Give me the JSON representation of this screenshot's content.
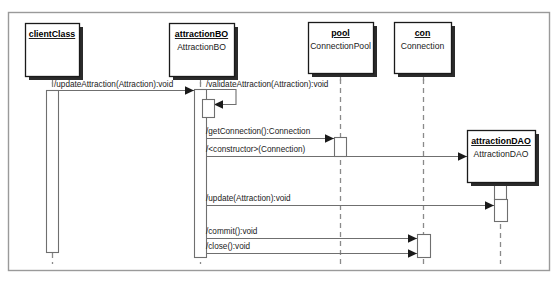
{
  "diagram": {
    "kind": "uml-sequence-diagram",
    "frame": {
      "x": 8,
      "y": 12,
      "width": 541,
      "height": 258
    },
    "colors": {
      "background": "#ffffff",
      "frame_border": "#9a9a9a",
      "box_border": "#1a1a1a",
      "box_fill": "#ffffff",
      "shadow": "#2b2b2b",
      "lifeline": "#8a8a8a",
      "message": "#6f6f6f",
      "arrowhead": "#1a1a1a",
      "text": "#1a1a1a"
    },
    "participants": [
      {
        "id": "clientClass",
        "name": "clientClass",
        "type": "",
        "box": {
          "x": 25,
          "y": 23,
          "width": 54,
          "height": 53
        },
        "lifeline_x": 52,
        "lifeline_top": 76,
        "lifeline_bottom": 264,
        "activations": [
          {
            "x": 46,
            "y": 90,
            "width": 12,
            "height": 162
          }
        ]
      },
      {
        "id": "attractionBO",
        "name": "attractionBO",
        "type": "AttractionBO",
        "box": {
          "x": 169,
          "y": 23,
          "width": 65,
          "height": 53
        },
        "lifeline_x": 200,
        "lifeline_top": 76,
        "lifeline_bottom": 264,
        "activations": [
          {
            "x": 194,
            "y": 89,
            "width": 12,
            "height": 168
          },
          {
            "x": 202,
            "y": 99,
            "width": 12,
            "height": 18
          }
        ]
      },
      {
        "id": "pool",
        "name": "pool",
        "type": "ConnectionPool",
        "box": {
          "x": 308,
          "y": 22,
          "width": 65,
          "height": 51
        },
        "lifeline_x": 340,
        "lifeline_top": 73,
        "lifeline_bottom": 264,
        "activations": [
          {
            "x": 334,
            "y": 137,
            "width": 12,
            "height": 19
          }
        ]
      },
      {
        "id": "con",
        "name": "con",
        "type": "Connection",
        "box": {
          "x": 394,
          "y": 22,
          "width": 57,
          "height": 51
        },
        "lifeline_x": 423,
        "lifeline_top": 73,
        "lifeline_bottom": 264,
        "activations": [
          {
            "x": 417,
            "y": 234,
            "width": 13,
            "height": 23
          }
        ]
      },
      {
        "id": "attractionDAO",
        "name": "attractionDAO",
        "type": "AttractionDAO",
        "box": {
          "x": 467,
          "y": 130,
          "width": 68,
          "height": 52
        },
        "lifeline_x": 500,
        "lifeline_top": 182,
        "lifeline_bottom": 264,
        "activations": [
          {
            "x": 494,
            "y": 182,
            "width": 12,
            "height": 17
          },
          {
            "x": 494,
            "y": 199,
            "width": 13,
            "height": 22
          }
        ]
      }
    ],
    "messages": [
      {
        "id": "msg-update-attraction",
        "label": "/updateAttraction(Attraction):void",
        "from": "clientClass",
        "to": "attractionBO",
        "y": 90,
        "x1": 52,
        "x2": 194,
        "label_x": 54,
        "label_y": 87,
        "kind": "call"
      },
      {
        "id": "msg-validate-attraction",
        "label": "/validateAttraction(Attraction):void",
        "from": "attractionBO",
        "to": "attractionBO",
        "y": 89,
        "x1": 204,
        "x2": 236,
        "label_x": 206,
        "label_y": 87,
        "kind": "self-call",
        "self_return_y": 104,
        "self_return_x": 214
      },
      {
        "id": "msg-get-connection",
        "label": "/getConnection():Connection",
        "from": "attractionBO",
        "to": "pool",
        "y": 138,
        "x1": 206,
        "x2": 334,
        "label_x": 206,
        "label_y": 134,
        "kind": "call"
      },
      {
        "id": "msg-constructor",
        "label": "/<constructor>(Connection)",
        "from": "attractionBO",
        "to": "attractionDAO",
        "y": 156,
        "x1": 206,
        "x2": 467,
        "label_x": 206,
        "label_y": 152,
        "kind": "create"
      },
      {
        "id": "msg-update",
        "label": "/update(Attraction):void",
        "from": "attractionBO",
        "to": "attractionDAO",
        "y": 205,
        "x1": 206,
        "x2": 494,
        "label_x": 206,
        "label_y": 201,
        "kind": "call"
      },
      {
        "id": "msg-commit",
        "label": "/commit():void",
        "from": "attractionBO",
        "to": "con",
        "y": 238,
        "x1": 206,
        "x2": 417,
        "label_x": 206,
        "label_y": 234,
        "kind": "call"
      },
      {
        "id": "msg-close",
        "label": "/close():void",
        "from": "attractionBO",
        "to": "con",
        "y": 253,
        "x1": 206,
        "x2": 417,
        "label_x": 206,
        "label_y": 249,
        "kind": "call"
      }
    ]
  }
}
